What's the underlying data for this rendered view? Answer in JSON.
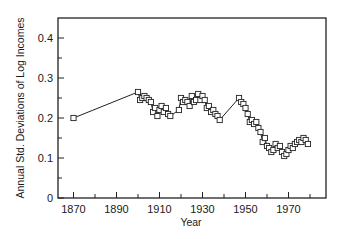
{
  "chart_data": {
    "type": "line",
    "title": "",
    "xlabel": "Year",
    "ylabel": "Annual Std. Deviations of Log Incomes",
    "xlim": [
      1863,
      1988
    ],
    "ylim": [
      0,
      0.45
    ],
    "xticks": [
      1870,
      1880,
      1890,
      1900,
      1910,
      1920,
      1930,
      1940,
      1950,
      1960,
      1970,
      1980
    ],
    "xtick_labels": [
      "1870",
      "1890",
      "1910",
      "1930",
      "1950",
      "1970"
    ],
    "yticks": [
      0,
      0.05,
      0.1,
      0.15,
      0.2,
      0.25,
      0.3,
      0.35,
      0.4
    ],
    "ytick_labels": [
      "0",
      "0.1",
      "0.2",
      "0.3",
      "0.4"
    ],
    "grid": false,
    "legend": null,
    "marker": "open-square",
    "series": [
      {
        "name": "Annual Std. Deviations of Log Incomes",
        "x": [
          1870,
          1900,
          1901,
          1902,
          1903,
          1904,
          1905,
          1906,
          1907,
          1908,
          1909,
          1910,
          1911,
          1912,
          1913,
          1914,
          1915,
          1919,
          1920,
          1921,
          1922,
          1923,
          1924,
          1925,
          1926,
          1927,
          1928,
          1929,
          1930,
          1931,
          1932,
          1933,
          1934,
          1935,
          1936,
          1937,
          1938,
          1947,
          1948,
          1949,
          1950,
          1951,
          1952,
          1953,
          1954,
          1955,
          1956,
          1957,
          1958,
          1959,
          1960,
          1961,
          1962,
          1963,
          1964,
          1965,
          1966,
          1967,
          1968,
          1969,
          1970,
          1971,
          1972,
          1973,
          1974,
          1975,
          1976,
          1977,
          1978,
          1979
        ],
        "values": [
          0.2,
          0.265,
          0.245,
          0.25,
          0.255,
          0.25,
          0.245,
          0.24,
          0.215,
          0.225,
          0.205,
          0.22,
          0.23,
          0.215,
          0.225,
          0.21,
          0.205,
          0.22,
          0.25,
          0.24,
          0.245,
          0.24,
          0.23,
          0.255,
          0.24,
          0.245,
          0.26,
          0.245,
          0.255,
          0.245,
          0.225,
          0.23,
          0.215,
          0.22,
          0.21,
          0.205,
          0.195,
          0.25,
          0.24,
          0.235,
          0.225,
          0.21,
          0.19,
          0.195,
          0.185,
          0.19,
          0.175,
          0.165,
          0.14,
          0.15,
          0.13,
          0.125,
          0.115,
          0.12,
          0.135,
          0.125,
          0.13,
          0.115,
          0.105,
          0.11,
          0.12,
          0.13,
          0.125,
          0.135,
          0.14,
          0.145,
          0.14,
          0.15,
          0.145,
          0.135
        ]
      }
    ]
  }
}
